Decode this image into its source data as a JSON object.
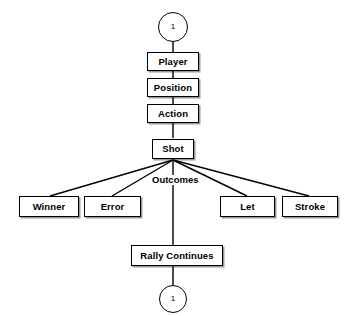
{
  "diagram": {
    "line_color": "#000000",
    "box_fill": "#ffffff",
    "entry_connector": {
      "label": "1",
      "name": "entry-connector"
    },
    "exit_connector": {
      "label": "1",
      "name": "exit-connector"
    },
    "chain": [
      {
        "label": "Player",
        "name": "node-player"
      },
      {
        "label": "Position",
        "name": "node-position"
      },
      {
        "label": "Action",
        "name": "node-action"
      },
      {
        "label": "Shot",
        "name": "node-shot"
      }
    ],
    "branch_label": "Outcomes",
    "outcomes": [
      {
        "label": "Winner",
        "name": "node-outcome-winner"
      },
      {
        "label": "Error",
        "name": "node-outcome-error"
      },
      {
        "label": "Rally Continues",
        "name": "node-outcome-rally-continues"
      },
      {
        "label": "Let",
        "name": "node-outcome-let"
      },
      {
        "label": "Stroke",
        "name": "node-outcome-stroke"
      }
    ]
  }
}
